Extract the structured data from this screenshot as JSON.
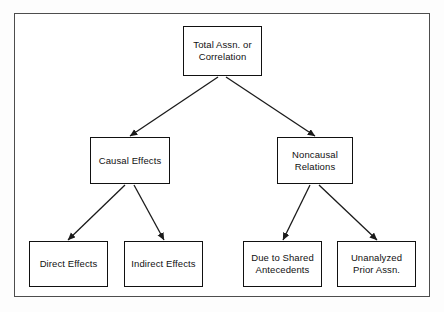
{
  "figure": {
    "background_color": "#ffffff",
    "frame_color": "#4d4d4d",
    "box_border_color": "#111111",
    "text_color": "#111111",
    "arrow_color": "#1a1a1a"
  },
  "nodes": [
    {
      "id": "total",
      "label": "Total Assn. or\nCorrelation",
      "level": 1,
      "x": 183,
      "y": 26,
      "width": 79,
      "height": 50
    },
    {
      "id": "causal",
      "label": "Causal Effects",
      "level": 2,
      "x": 90,
      "y": 137,
      "width": 80,
      "height": 47
    },
    {
      "id": "noncausal",
      "label": "Noncausal\nRelations",
      "level": 2,
      "x": 277,
      "y": 137,
      "width": 76,
      "height": 47
    },
    {
      "id": "direct",
      "label": "Direct Effects",
      "level": 3,
      "x": 29,
      "y": 241,
      "width": 79,
      "height": 46
    },
    {
      "id": "indirect",
      "label": "Indirect Effects",
      "level": 3,
      "x": 124,
      "y": 241,
      "width": 79,
      "height": 46
    },
    {
      "id": "shared",
      "label": "Due to Shared\nAntecedents",
      "level": 3,
      "x": 243,
      "y": 241,
      "width": 79,
      "height": 46
    },
    {
      "id": "unanalyzed",
      "label": "Unanalyzed\nPrior Assn.",
      "level": 3,
      "x": 337,
      "y": 241,
      "width": 79,
      "height": 46
    }
  ],
  "edges": [
    {
      "id": "total-causal",
      "from": "total",
      "to": "causal",
      "x1": 218,
      "y1": 77,
      "x2": 130,
      "y2": 136
    },
    {
      "id": "total-noncausal",
      "from": "total",
      "to": "noncausal",
      "x1": 226,
      "y1": 77,
      "x2": 315,
      "y2": 136
    },
    {
      "id": "causal-direct",
      "from": "causal",
      "to": "direct",
      "x1": 125,
      "y1": 185,
      "x2": 68,
      "y2": 240
    },
    {
      "id": "causal-indirect",
      "from": "causal",
      "to": "indirect",
      "x1": 134,
      "y1": 185,
      "x2": 164,
      "y2": 240
    },
    {
      "id": "noncausal-shared",
      "from": "noncausal",
      "to": "shared",
      "x1": 310,
      "y1": 185,
      "x2": 283,
      "y2": 240
    },
    {
      "id": "noncausal-unanalyzed",
      "from": "noncausal",
      "to": "unanalyzed",
      "x1": 319,
      "y1": 185,
      "x2": 377,
      "y2": 240
    }
  ],
  "chart_data": {
    "type": "diagram",
    "diagram_kind": "hierarchical tree",
    "levels": 3,
    "hierarchy": {
      "label": "Total Assn. or Correlation",
      "children": [
        {
          "label": "Causal Effects",
          "children": [
            {
              "label": "Direct Effects"
            },
            {
              "label": "Indirect Effects"
            }
          ]
        },
        {
          "label": "Noncausal Relations",
          "children": [
            {
              "label": "Due to Shared Antecedents"
            },
            {
              "label": "Unanalyzed Prior Assn."
            }
          ]
        }
      ]
    }
  }
}
